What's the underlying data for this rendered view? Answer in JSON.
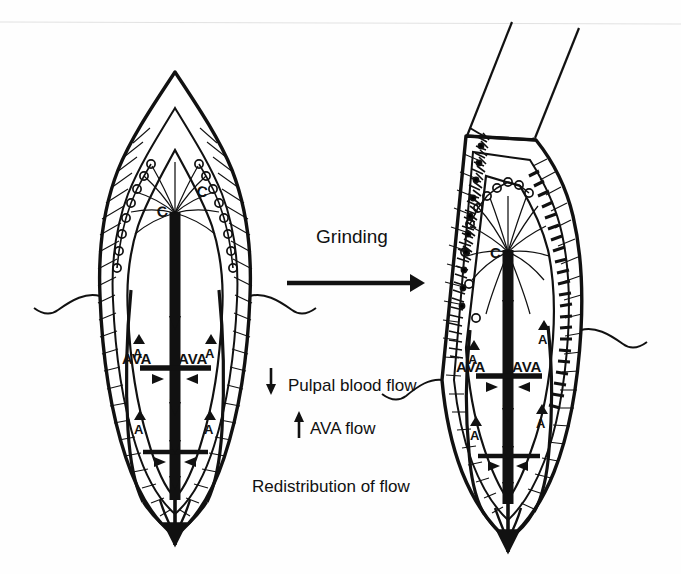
{
  "figure": {
    "type": "anatomical-diagram",
    "background_color": "#fefefe",
    "ink_color": "#111111"
  },
  "process": {
    "label": "Grinding",
    "arrow_name": "grinding-arrow",
    "direction": "left-to-right"
  },
  "legend": {
    "items": [
      {
        "arrow": "down",
        "label": "Pulpal blood flow"
      },
      {
        "arrow": "up",
        "label": "AVA flow"
      }
    ],
    "caption": "Redistribution of flow"
  },
  "panels": [
    {
      "id": "left",
      "name": "intact-tooth",
      "state": "before-grinding",
      "crown_intact": true,
      "ground_surface": false,
      "capillary_label": "C",
      "artery_labels": [
        "A",
        "A",
        "A",
        "A"
      ],
      "vein_labels": [
        "V",
        "V"
      ],
      "ava_labels": [
        "AVA",
        "AVA"
      ],
      "capillary_loop_count": 16,
      "sprouting_capillaries": false
    },
    {
      "id": "right",
      "name": "ground-tooth",
      "state": "after-grinding",
      "crown_intact": false,
      "ground_surface": true,
      "bur_name": "grinding-bur",
      "capillary_label": "C",
      "artery_labels": [
        "A",
        "A",
        "A",
        "A"
      ],
      "vein_labels": [
        "V",
        "V"
      ],
      "ava_labels": [
        "AVA",
        "AVA"
      ],
      "capillary_loop_count": 10,
      "sprouting_capillaries": true,
      "odontoblast_layer_dense": true
    }
  ]
}
